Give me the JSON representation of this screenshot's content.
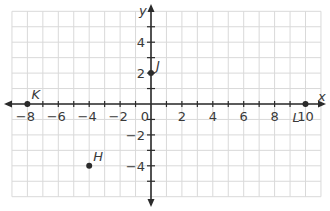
{
  "chart_data": {
    "type": "scatter",
    "title": "",
    "xlabel": "x",
    "ylabel": "y",
    "grid": true,
    "xlim": [
      -9,
      11
    ],
    "ylim": [
      -6,
      6
    ],
    "x_ticks": [
      -8,
      -6,
      -4,
      -2,
      0,
      2,
      4,
      6,
      8,
      10
    ],
    "x_tick_labels": [
      "-8",
      "-6",
      "-4",
      "-2",
      "0",
      "2",
      "4",
      "6",
      "8",
      "10"
    ],
    "y_ticks": [
      -4,
      -2,
      2,
      4
    ],
    "y_tick_labels": [
      "-4",
      "-2",
      "2",
      "4"
    ],
    "points": [
      {
        "label": "K",
        "x": -8,
        "y": 0
      },
      {
        "label": "J",
        "x": 0,
        "y": 2
      },
      {
        "label": "H",
        "x": -4,
        "y": -4
      },
      {
        "label": "L",
        "x": 10,
        "y": 0
      }
    ]
  },
  "colors": {
    "grid": "#d9d9d9",
    "axis": "#2b2b2b",
    "text": "#3a3a3a",
    "point": "#2b2b2b"
  }
}
